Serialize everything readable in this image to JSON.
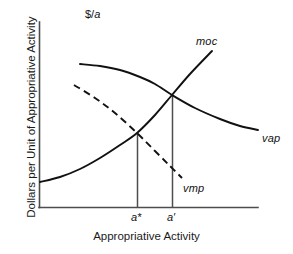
{
  "figure": {
    "title": "",
    "background_color": "#ffffff",
    "width": 293,
    "height": 254
  },
  "axes": {
    "y_unit_label": "$/a",
    "y_unit_label_prefix": "$/",
    "y_unit_label_italic": "a",
    "y_axis_title": "Dollars per Unit of Appropriative Activity",
    "x_axis_title": "Appropriative Activity",
    "axis_color": "#4d4d4d",
    "x_origin_px": 39,
    "x_end_px": 258,
    "y_top_px": 22,
    "y_baseline_px": 207
  },
  "labels": {
    "moc": "moc",
    "vap": "vap",
    "vmp": "vmp",
    "a_star": "a*",
    "a_prime": "a′"
  },
  "chart_data": {
    "type": "line",
    "title": "",
    "xlabel": "Appropriative Activity",
    "ylabel": "Dollars per Unit of Appropriative Activity",
    "y_unit": "$/a",
    "grid": false,
    "legend": "inline-curve-labels",
    "axis_ticks": {
      "x_ticks": [
        "a*",
        "a′"
      ],
      "x_tick_positions_px": [
        137,
        172
      ],
      "y_ticks": []
    },
    "series": [
      {
        "name": "moc",
        "label": "moc",
        "description": "marginal opportunity cost - upward sloping convex curve",
        "style": "solid",
        "color": "#111111",
        "points_px": [
          [
            40,
            182
          ],
          [
            60,
            177
          ],
          [
            80,
            169
          ],
          [
            100,
            158
          ],
          [
            120,
            145
          ],
          [
            137,
            133
          ],
          [
            155,
            115
          ],
          [
            172,
            95
          ],
          [
            190,
            74
          ],
          [
            212,
            51
          ]
        ]
      },
      {
        "name": "vap",
        "label": "vap",
        "description": "value of average product - downward sloping concave curve",
        "style": "solid",
        "color": "#111111",
        "points_px": [
          [
            80,
            64
          ],
          [
            100,
            66
          ],
          [
            120,
            70
          ],
          [
            140,
            77
          ],
          [
            155,
            84
          ],
          [
            172,
            95
          ],
          [
            195,
            108
          ],
          [
            220,
            119
          ],
          [
            240,
            126
          ],
          [
            258,
            130
          ]
        ]
      },
      {
        "name": "vmp",
        "label": "vmp",
        "description": "value of marginal product - downward sloping dashed curve",
        "style": "dashed",
        "color": "#111111",
        "points_px": [
          [
            74,
            85
          ],
          [
            95,
            98
          ],
          [
            115,
            113
          ],
          [
            137,
            133
          ],
          [
            155,
            151
          ],
          [
            170,
            166
          ],
          [
            182,
            178
          ]
        ]
      }
    ],
    "annotations": [
      {
        "name": "a-star-drop-line",
        "x_px": 137,
        "from_y_px": 133,
        "to_y_px": 207,
        "meaning": "equilibrium where moc intersects vmp"
      },
      {
        "name": "a-prime-drop-line",
        "x_px": 172,
        "from_y_px": 95,
        "to_y_px": 207,
        "meaning": "equilibrium where moc intersects vap"
      }
    ],
    "intersections": [
      {
        "curves": [
          "moc",
          "vmp"
        ],
        "x_label": "a*",
        "point_px": [
          137,
          133
        ]
      },
      {
        "curves": [
          "moc",
          "vap"
        ],
        "x_label": "a′",
        "point_px": [
          172,
          95
        ]
      }
    ]
  }
}
